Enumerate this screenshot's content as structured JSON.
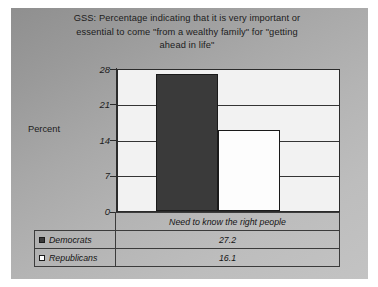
{
  "chart_data": {
    "type": "bar",
    "title": "GSS:  Percentage indicating that it is very important or essential to come \"from a wealthy family\" for \"getting ahead in life\"",
    "title_lines": [
      "GSS:  Percentage indicating that it is very important or",
      "essential to come \"from a wealthy family\" for \"getting",
      "ahead in life\""
    ],
    "categories": [
      "Need to know the right people"
    ],
    "series": [
      {
        "name": "Democrats",
        "values": [
          27.2
        ],
        "color": "#3a3a3a",
        "marker": "filled-square"
      },
      {
        "name": "Republicans",
        "values": [
          16.1
        ],
        "color": "#ffffff",
        "marker": "empty-square"
      }
    ],
    "xlabel": "",
    "ylabel": "Percent",
    "ylim": [
      0,
      28
    ],
    "yticks": [
      0,
      7,
      14,
      21,
      28
    ],
    "ytick_labels": [
      "0",
      "7",
      "14",
      "21",
      "28"
    ],
    "grid": true,
    "legend_position": "bottom-table"
  },
  "axis": {
    "y_title": "Percent"
  },
  "table": {
    "category_header": "Need to know the right people",
    "rows": [
      {
        "label": "Democrats",
        "value": "27.2"
      },
      {
        "label": "Republicans",
        "value": "16.1"
      }
    ]
  },
  "colors": {
    "democrat_bar": "#3a3a3a",
    "republican_bar": "#ffffff",
    "plot_background": "#f2f2f2",
    "frame": "#2b2b2b"
  }
}
